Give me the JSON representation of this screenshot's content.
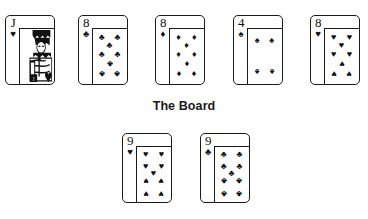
{
  "figure": {
    "background_color": "#ffffff",
    "ink_color": "#111111"
  },
  "board_label": {
    "text": "The Board",
    "x": 0,
    "y": 99
  },
  "suit_glyphs": {
    "hearts": "♥",
    "diamonds": "♦",
    "clubs": "♣",
    "spades": "♠"
  },
  "hand_row": {
    "name": "top-card-row",
    "cards": [
      {
        "rank": "J",
        "suit": "hearts",
        "suit_glyph": "♥",
        "label": "Jack of Hearts",
        "type": "court",
        "x": 5,
        "y": 15
      },
      {
        "rank": "8",
        "suit": "clubs",
        "suit_glyph": "♣",
        "label": "Eight of Clubs",
        "type": "pip",
        "x": 78,
        "y": 15
      },
      {
        "rank": "8",
        "suit": "diamonds",
        "suit_glyph": "♦",
        "label": "Eight of Diamonds",
        "type": "pip",
        "x": 155,
        "y": 15
      },
      {
        "rank": "4",
        "suit": "spades",
        "suit_glyph": "♠",
        "label": "Four of Spades",
        "type": "pip",
        "x": 233,
        "y": 15
      },
      {
        "rank": "8",
        "suit": "hearts",
        "suit_glyph": "♥",
        "label": "Eight of Hearts",
        "type": "pip",
        "x": 310,
        "y": 15
      }
    ]
  },
  "board_row": {
    "name": "board-card-row",
    "cards": [
      {
        "rank": "9",
        "suit": "hearts",
        "suit_glyph": "♥",
        "label": "Nine of Hearts",
        "type": "pip",
        "x": 122,
        "y": 133
      },
      {
        "rank": "9",
        "suit": "clubs",
        "suit_glyph": "♣",
        "label": "Nine of Clubs",
        "type": "pip",
        "x": 200,
        "y": 133
      }
    ]
  },
  "pip_layouts": {
    "4": [
      {
        "x": 28,
        "y": 20,
        "inv": false
      },
      {
        "x": 72,
        "y": 20,
        "inv": false
      },
      {
        "x": 28,
        "y": 78,
        "inv": true
      },
      {
        "x": 72,
        "y": 78,
        "inv": true
      }
    ],
    "8": [
      {
        "x": 26,
        "y": 14,
        "inv": false
      },
      {
        "x": 74,
        "y": 14,
        "inv": false
      },
      {
        "x": 50,
        "y": 30,
        "inv": false
      },
      {
        "x": 26,
        "y": 46,
        "inv": false
      },
      {
        "x": 74,
        "y": 46,
        "inv": false
      },
      {
        "x": 50,
        "y": 63,
        "inv": true
      },
      {
        "x": 26,
        "y": 82,
        "inv": true
      },
      {
        "x": 74,
        "y": 82,
        "inv": true
      }
    ],
    "9": [
      {
        "x": 26,
        "y": 13,
        "inv": false
      },
      {
        "x": 74,
        "y": 13,
        "inv": false
      },
      {
        "x": 26,
        "y": 35,
        "inv": false
      },
      {
        "x": 74,
        "y": 35,
        "inv": false
      },
      {
        "x": 50,
        "y": 48,
        "inv": false
      },
      {
        "x": 26,
        "y": 62,
        "inv": true
      },
      {
        "x": 74,
        "y": 62,
        "inv": true
      },
      {
        "x": 26,
        "y": 85,
        "inv": true
      },
      {
        "x": 74,
        "y": 85,
        "inv": true
      }
    ]
  }
}
